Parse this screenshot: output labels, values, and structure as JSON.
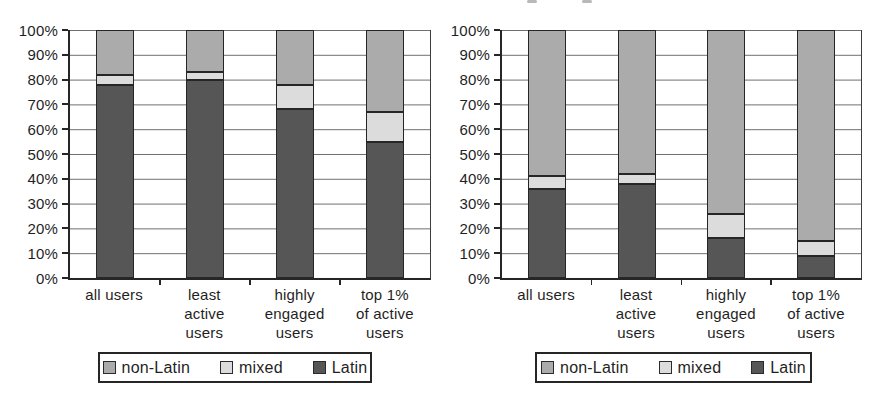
{
  "figure": {
    "background": "#ffffff",
    "text_color": "#1f1f1f",
    "style": "grayscale scanned stacked-bar figure, two panels side by side"
  },
  "colors": {
    "latin": "#565656",
    "mixed": "#dcdcdc",
    "non_latin": "#ababab",
    "gridline": "#6e6e6e",
    "axis": "#262626"
  },
  "yticks": [
    "100%",
    "90%",
    "80%",
    "70%",
    "60%",
    "50%",
    "40%",
    "30%",
    "20%",
    "10%",
    "0%"
  ],
  "legend": [
    "non-Latin",
    "mixed",
    "Latin"
  ],
  "chart_data": [
    {
      "type": "bar",
      "stacked": true,
      "title": "",
      "xlabel": "",
      "ylabel": "",
      "ylim": [
        0,
        100
      ],
      "ytick_step": 10,
      "grid": true,
      "legend_position": "bottom",
      "categories": [
        "all users",
        "least\nactive\nusers",
        "highly\nengaged\nusers",
        "top 1%\nof active\nusers"
      ],
      "series": [
        {
          "name": "Latin",
          "color": "#565656",
          "values": [
            78,
            80,
            68,
            55
          ]
        },
        {
          "name": "mixed",
          "color": "#dcdcdc",
          "values": [
            4,
            3,
            10,
            12
          ]
        },
        {
          "name": "non-Latin",
          "color": "#ababab",
          "values": [
            18,
            17,
            22,
            33
          ]
        }
      ]
    },
    {
      "type": "bar",
      "stacked": true,
      "title": "",
      "xlabel": "",
      "ylabel": "",
      "ylim": [
        0,
        100
      ],
      "ytick_step": 10,
      "grid": true,
      "legend_position": "bottom",
      "categories": [
        "all users",
        "least\nactive\nusers",
        "highly\nengaged\nusers",
        "top 1%\nof active\nusers"
      ],
      "series": [
        {
          "name": "Latin",
          "color": "#565656",
          "values": [
            36,
            38,
            16,
            9
          ]
        },
        {
          "name": "mixed",
          "color": "#dcdcdc",
          "values": [
            5,
            4,
            10,
            6
          ]
        },
        {
          "name": "non-Latin",
          "color": "#ababab",
          "values": [
            59,
            58,
            74,
            85
          ]
        }
      ]
    }
  ]
}
